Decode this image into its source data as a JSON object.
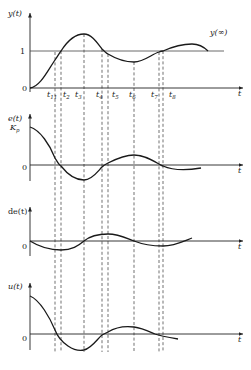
{
  "diagram": {
    "panels": [
      {
        "id": "output",
        "y_label": "y(t)",
        "zero_label": "0",
        "level_label": "1",
        "steady_state_label": "y(∞)",
        "x_label": "t"
      },
      {
        "id": "error",
        "y_label": "e(t)",
        "initial_label": "K",
        "initial_sub": "p",
        "zero_label": "0",
        "x_label": "t"
      },
      {
        "id": "error-derivative",
        "y_label": "de(t)",
        "zero_label": "0",
        "x_label": "t"
      },
      {
        "id": "control",
        "y_label": "u(t)",
        "zero_label": "0",
        "x_label": "t"
      }
    ],
    "time_markers": [
      {
        "label": "t",
        "sub": "11"
      },
      {
        "label": "t",
        "sub": "2"
      },
      {
        "label": "t",
        "sub": "3"
      },
      {
        "label": "t",
        "sub": "4"
      },
      {
        "label": "t",
        "sub": "5"
      },
      {
        "label": "t",
        "sub": "6"
      },
      {
        "label": "t",
        "sub": "7"
      },
      {
        "label": "t",
        "sub": "8"
      }
    ]
  }
}
